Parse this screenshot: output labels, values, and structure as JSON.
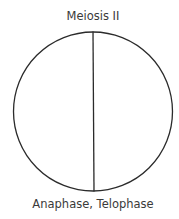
{
  "diagram": {
    "title": "Meiosis II",
    "caption": "Anaphase, Telophase",
    "shape": "cell-circle-divided-vertically",
    "stroke_color": "#2b2b2b",
    "background": "#ffffff"
  }
}
